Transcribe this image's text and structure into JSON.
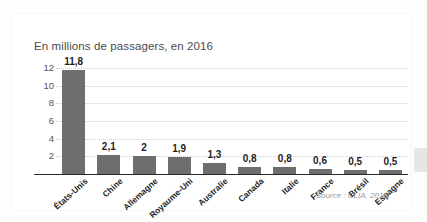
{
  "chart_data": {
    "type": "bar",
    "title": "En millions de passagers, en 2016",
    "xlabel": "",
    "ylabel": "",
    "ylim": [
      0,
      13
    ],
    "yticks": [
      2,
      4,
      6,
      8,
      10,
      12
    ],
    "ytick_labels": [
      "2",
      "4",
      "6",
      "8",
      "10",
      "12"
    ],
    "grid": true,
    "legend": false,
    "source": "Source : CLIA, 2016.",
    "bar_color": "#6e6e6e",
    "categories": [
      "États-Unis",
      "Chine",
      "Allemagne",
      "Royaume-Uni",
      "Australie",
      "Canada",
      "Italie",
      "France",
      "Brésil",
      "Espagne"
    ],
    "values": [
      11.8,
      2.1,
      2,
      1.9,
      1.3,
      0.8,
      0.8,
      0.6,
      0.5,
      0.5
    ],
    "value_labels": [
      "11,8",
      "2,1",
      "2",
      "1,9",
      "1,3",
      "0,8",
      "0,8",
      "0,6",
      "0,5",
      "0,5"
    ]
  },
  "colors": {
    "bar": "#6e6e6e",
    "axis": "#2b2b2b",
    "grid": "#cfcfcf",
    "title_text": "#4a4a4a",
    "card": "#ffffff"
  }
}
